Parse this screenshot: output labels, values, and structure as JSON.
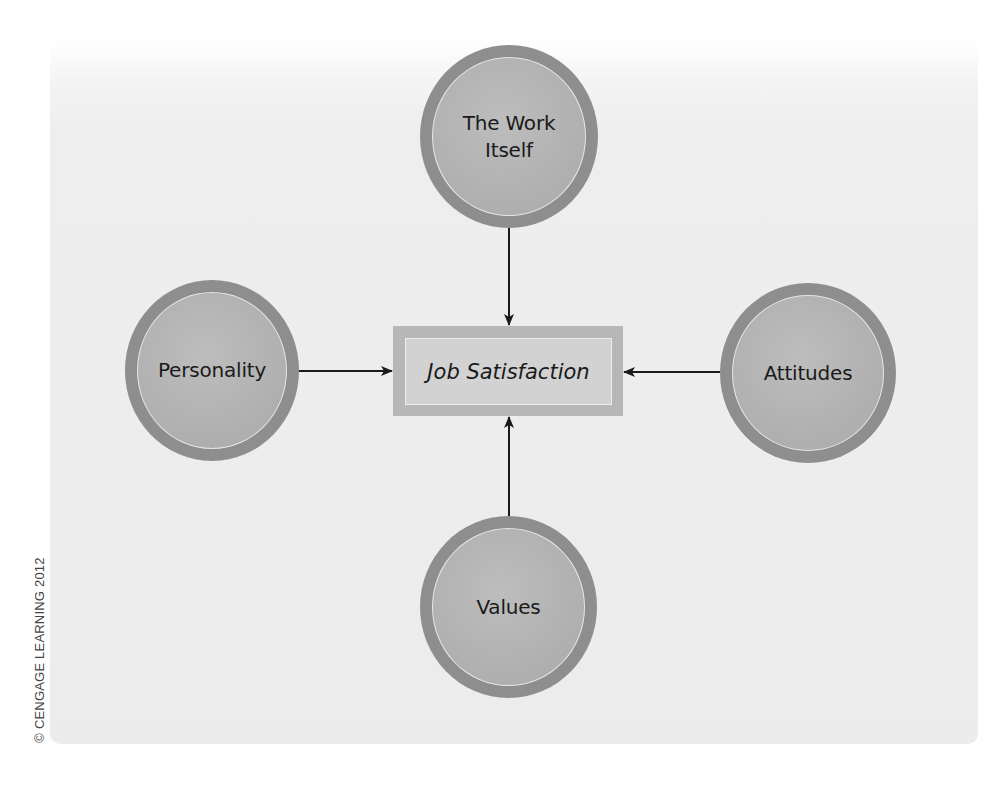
{
  "diagram": {
    "center": {
      "label": "Job Satisfaction"
    },
    "nodes": [
      {
        "id": "work-itself",
        "label_line1": "The Work",
        "label_line2": "Itself"
      },
      {
        "id": "personality",
        "label": "Personality"
      },
      {
        "id": "attitudes",
        "label": "Attitudes"
      },
      {
        "id": "values",
        "label": "Values"
      }
    ],
    "edges": [
      {
        "from": "The Work Itself",
        "to": "Job Satisfaction"
      },
      {
        "from": "Personality",
        "to": "Job Satisfaction"
      },
      {
        "from": "Attitudes",
        "to": "Job Satisfaction"
      },
      {
        "from": "Values",
        "to": "Job Satisfaction"
      }
    ]
  },
  "copyright": "© CENGAGE LEARNING 2012",
  "colors": {
    "node_ring": "#8e8e8e",
    "node_fill": "#b2b2b2",
    "box_outer": "#b7b7b7",
    "box_inner": "#d2d2d2",
    "arrow": "#1a1a1a",
    "panel": "#ececec"
  }
}
